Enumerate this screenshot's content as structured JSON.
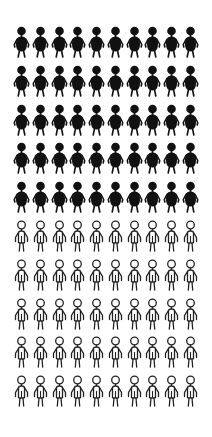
{
  "chart_data": {
    "type": "pictogram",
    "title": "",
    "rows": 10,
    "columns": 10,
    "total": 100,
    "series": [
      {
        "name": "filled",
        "style": "solid",
        "count": 50,
        "color": "#111111"
      },
      {
        "name": "outlined",
        "style": "outline",
        "count": 50,
        "color": "#222222"
      }
    ],
    "values": [
      50,
      50
    ],
    "unit": "person icon",
    "legend": "none",
    "grid": false
  },
  "colors": {
    "background": "#ffffff",
    "filled": "#111111",
    "outline": "#222222"
  }
}
